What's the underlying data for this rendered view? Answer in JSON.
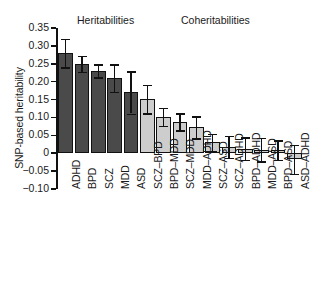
{
  "axis": {
    "y_title": "SNP-based heritability",
    "y_ticks": [
      "0.35",
      "0.30",
      "0.25",
      "0.20",
      "0.15",
      "0.10",
      "0.05",
      "0",
      "-0.05",
      "-0.10"
    ],
    "y_tick_values": [
      0.35,
      0.3,
      0.25,
      0.2,
      0.15,
      0.1,
      0.05,
      0,
      -0.05,
      -0.1
    ],
    "y_min": -0.1,
    "y_max": 0.35
  },
  "headers": {
    "heritabilities": "Heritabilities",
    "coheritabilities": "Coheritabilities"
  },
  "colors": {
    "heritability_bar": "#4a4a4a",
    "coheritability_bar": "#cdcdcd",
    "outline": "#111111",
    "text": "#1a1a1a",
    "background": "#ffffff"
  },
  "chart_data": {
    "type": "bar",
    "title": "",
    "xlabel": "",
    "ylabel": "SNP-based heritability",
    "ylim": [
      -0.1,
      0.35
    ],
    "grid": false,
    "legend": "none",
    "categories": [
      "ADHD",
      "BPD",
      "SCZ",
      "MDD",
      "ASD",
      "SCZ-BPD",
      "BPD-MDD",
      "SCZ-MDD",
      "MDD-ADHD",
      "SCZ-ASD",
      "SCZ-ADHD",
      "BPD-ADHD",
      "MDD-ASD",
      "BPD-ASD",
      "ASD-ADHD"
    ],
    "values": [
      0.28,
      0.25,
      0.23,
      0.21,
      0.17,
      0.152,
      0.102,
      0.088,
      0.072,
      0.03,
      0.018,
      0.012,
      0.01,
      0.008,
      -0.017
    ],
    "err_low": [
      0.24,
      0.228,
      0.212,
      0.172,
      0.111,
      0.112,
      0.077,
      0.064,
      0.042,
      0.005,
      -0.013,
      -0.019,
      -0.023,
      -0.019,
      -0.058
    ],
    "err_high": [
      0.32,
      0.272,
      0.249,
      0.249,
      0.229,
      0.192,
      0.127,
      0.112,
      0.103,
      0.055,
      0.049,
      0.044,
      0.043,
      0.036,
      0.024
    ],
    "groups": [
      "heritability",
      "heritability",
      "heritability",
      "heritability",
      "heritability",
      "coheritability",
      "coheritability",
      "coheritability",
      "coheritability",
      "coheritability",
      "coheritability",
      "coheritability",
      "coheritability",
      "coheritability",
      "coheritability"
    ]
  }
}
